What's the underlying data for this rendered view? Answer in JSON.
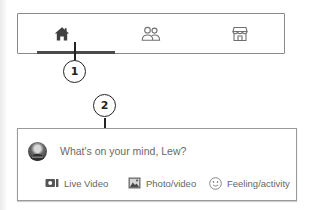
{
  "navbar": {
    "tabs": [
      {
        "icon": "home-icon",
        "label": "Home",
        "active": true
      },
      {
        "icon": "friends-icon",
        "label": "Friends",
        "active": false
      },
      {
        "icon": "marketplace-icon",
        "label": "Marketplace",
        "active": false
      }
    ]
  },
  "callouts": [
    {
      "number": "1"
    },
    {
      "number": "2"
    }
  ],
  "composer": {
    "avatar": "profile-photo",
    "prompt": "What's on your mind, Lew?",
    "actions": [
      {
        "icon": "live-video-icon",
        "label": "Live Video"
      },
      {
        "icon": "photo-icon",
        "label": "Photo/video"
      },
      {
        "icon": "smiley-icon",
        "label": "Feeling/activity"
      }
    ]
  },
  "colors": {
    "border": "#8a8a8a",
    "active_icon": "#3f3f3f",
    "inactive_icon": "#707070",
    "text": "#666666",
    "callout": "#222222"
  }
}
